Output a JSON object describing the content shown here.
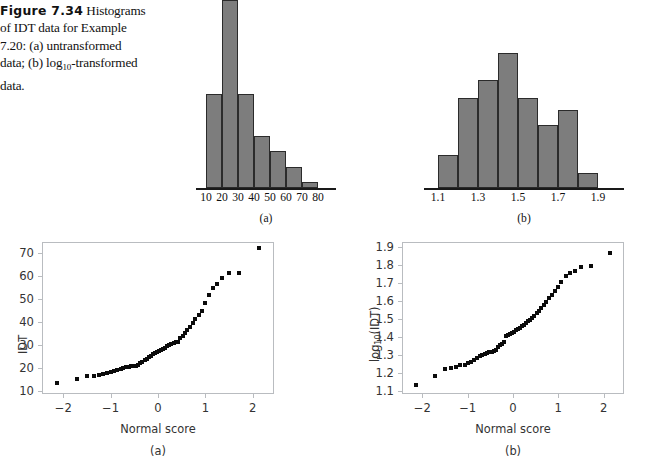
{
  "figure": {
    "label": "Figure 7.34",
    "caption_line1": "Histograms",
    "caption_line2": "of IDT data for Example",
    "caption_line3": "7.20: (a) untransformed",
    "caption_line4_pre": "data; (b) log",
    "caption_line4_sub": "10",
    "caption_line4_post": "-transformed",
    "caption_line5": "data."
  },
  "panels": {
    "hist_a_caption": "(a)",
    "hist_b_caption": "(b)",
    "qq_a_caption": "(a)",
    "qq_b_caption": "(b)"
  },
  "chart_data": [
    {
      "type": "bar",
      "id": "histogram-untransformed",
      "title": "",
      "subtitle": "(a)",
      "xlabel": "",
      "ylabel": "",
      "grid": false,
      "legend": "none",
      "bin_edges": [
        10,
        20,
        30,
        40,
        50,
        60,
        70,
        80
      ],
      "categories": [
        "10-20",
        "20-30",
        "30-40",
        "40-50",
        "50-60",
        "60-70",
        "70-80"
      ],
      "values": [
        9,
        18,
        9,
        5,
        3.5,
        2,
        0.6
      ],
      "tick_labels": [
        "10",
        "20",
        "30",
        "40",
        "50",
        "60",
        "70",
        "80"
      ],
      "xlim": [
        10,
        80
      ],
      "ylim": [
        0,
        18
      ],
      "bar_color": "#7d7d7d",
      "bar_edge_color": "#2b2b2b"
    },
    {
      "type": "bar",
      "id": "histogram-log10-transformed",
      "title": "",
      "subtitle": "(b)",
      "xlabel": "",
      "ylabel": "",
      "grid": false,
      "legend": "none",
      "bin_edges": [
        1.1,
        1.2,
        1.3,
        1.4,
        1.5,
        1.6,
        1.7,
        1.8,
        1.9
      ],
      "categories": [
        "1.1-1.2",
        "1.2-1.3",
        "1.3-1.4",
        "1.4-1.5",
        "1.5-1.6",
        "1.6-1.7",
        "1.7-1.8",
        "1.8-1.9"
      ],
      "values": [
        2.2,
        6.0,
        7.2,
        9.0,
        6.0,
        4.2,
        5.2,
        1.0
      ],
      "tick_labels": [
        "1.1",
        "1.3",
        "1.5",
        "1.7",
        "1.9"
      ],
      "tick_values": [
        1.1,
        1.3,
        1.5,
        1.7,
        1.9
      ],
      "xlim": [
        1.1,
        1.9
      ],
      "ylim": [
        0,
        9
      ],
      "bar_color": "#7d7d7d",
      "bar_edge_color": "#2b2b2b"
    },
    {
      "type": "scatter",
      "id": "normal-qq-untransformed",
      "title": "",
      "subtitle": "(a)",
      "xlabel": "Normal score",
      "ylabel": "IDT",
      "grid": false,
      "legend": "none",
      "xlim": [
        -2.45,
        2.45
      ],
      "ylim": [
        8.5,
        75
      ],
      "xticks": [
        -2,
        -1,
        0,
        1,
        2
      ],
      "xtick_labels": [
        "−2",
        "−1",
        "0",
        "1",
        "2"
      ],
      "yticks": [
        10,
        20,
        30,
        40,
        50,
        60,
        70
      ],
      "ytick_labels": [
        "10",
        "20",
        "30",
        "40",
        "50",
        "60",
        "70"
      ],
      "marker": "square",
      "marker_color": "#0b0b0b",
      "x": [
        -2.13,
        -1.72,
        -1.5,
        -1.36,
        -1.25,
        -1.16,
        -1.07,
        -0.99,
        -0.92,
        -0.86,
        -0.79,
        -0.73,
        -0.68,
        -0.62,
        -0.57,
        -0.52,
        -0.47,
        -0.42,
        -0.37,
        -0.33,
        -0.28,
        -0.24,
        -0.19,
        -0.15,
        -0.11,
        -0.06,
        -0.02,
        0.02,
        0.06,
        0.11,
        0.15,
        0.19,
        0.24,
        0.28,
        0.33,
        0.37,
        0.42,
        0.47,
        0.52,
        0.57,
        0.62,
        0.68,
        0.73,
        0.79,
        0.86,
        0.92,
        0.99,
        1.07,
        1.16,
        1.25,
        1.36,
        1.5,
        1.72,
        2.13
      ],
      "y": [
        13.2,
        14.9,
        16.2,
        16.4,
        16.8,
        17.2,
        17.6,
        18.2,
        18.6,
        19.0,
        19.4,
        19.8,
        20.3,
        20.5,
        20.6,
        20.6,
        20.8,
        21.4,
        22.0,
        22.7,
        23.4,
        24.0,
        24.6,
        25.2,
        25.8,
        26.4,
        26.9,
        27.4,
        27.9,
        28.4,
        28.8,
        29.3,
        29.8,
        30.3,
        30.8,
        31.3,
        31.4,
        32.8,
        34.0,
        35.2,
        36.6,
        38.0,
        39.6,
        41.2,
        43.0,
        45.0,
        48.2,
        51.8,
        54.8,
        56.6,
        59.4,
        61.4,
        61.6,
        72.4
      ]
    },
    {
      "type": "scatter",
      "id": "normal-qq-log10-transformed",
      "title": "",
      "subtitle": "(b)",
      "xlabel": "Normal score",
      "ylabel": "log10(IDT)",
      "ylabel_base": "log",
      "ylabel_sub": "10",
      "ylabel_tail": "(IDT)",
      "grid": false,
      "legend": "none",
      "xlim": [
        -2.45,
        2.45
      ],
      "ylim": [
        1.085,
        1.925
      ],
      "xticks": [
        -2,
        -1,
        0,
        1,
        2
      ],
      "xtick_labels": [
        "−2",
        "−1",
        "0",
        "1",
        "2"
      ],
      "yticks": [
        1.1,
        1.2,
        1.3,
        1.4,
        1.5,
        1.6,
        1.7,
        1.8,
        1.9
      ],
      "ytick_labels": [
        "1.1",
        "1.2",
        "1.3",
        "1.4",
        "1.5",
        "1.6",
        "1.7",
        "1.8",
        "1.9"
      ],
      "marker": "square",
      "marker_color": "#0b0b0b",
      "x": [
        -2.13,
        -1.72,
        -1.5,
        -1.36,
        -1.25,
        -1.16,
        -1.07,
        -0.99,
        -0.92,
        -0.86,
        -0.79,
        -0.73,
        -0.68,
        -0.62,
        -0.57,
        -0.52,
        -0.47,
        -0.42,
        -0.37,
        -0.33,
        -0.28,
        -0.24,
        -0.19,
        -0.15,
        -0.11,
        -0.06,
        -0.02,
        0.02,
        0.06,
        0.11,
        0.15,
        0.19,
        0.24,
        0.28,
        0.33,
        0.37,
        0.42,
        0.47,
        0.52,
        0.57,
        0.62,
        0.68,
        0.73,
        0.79,
        0.86,
        0.92,
        0.99,
        1.07,
        1.16,
        1.25,
        1.36,
        1.5,
        1.72,
        2.13
      ],
      "y": [
        1.135,
        1.186,
        1.222,
        1.226,
        1.234,
        1.243,
        1.248,
        1.258,
        1.264,
        1.272,
        1.283,
        1.293,
        1.302,
        1.308,
        1.312,
        1.315,
        1.318,
        1.324,
        1.33,
        1.342,
        1.354,
        1.364,
        1.372,
        1.404,
        1.409,
        1.414,
        1.42,
        1.428,
        1.438,
        1.446,
        1.452,
        1.46,
        1.468,
        1.478,
        1.486,
        1.496,
        1.504,
        1.514,
        1.53,
        1.546,
        1.562,
        1.578,
        1.596,
        1.614,
        1.634,
        1.652,
        1.678,
        1.706,
        1.738,
        1.752,
        1.766,
        1.786,
        1.794,
        1.864
      ]
    }
  ]
}
